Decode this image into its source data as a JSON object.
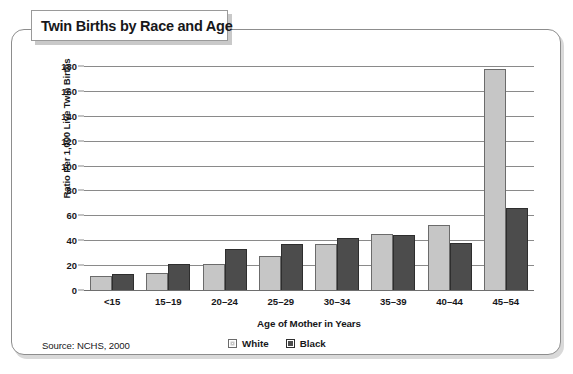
{
  "panel": {
    "title": "Twin Births by Race and Age",
    "source": "Source: NCHS, 2000"
  },
  "chart_data": {
    "type": "bar",
    "title": "Twin Births by Race and Age",
    "xlabel": "Age of Mother in Years",
    "ylabel": "Ratio Per 1,000 Live Twin Births",
    "ylim": [
      0,
      180
    ],
    "ytick_step": 20,
    "yticks": [
      0,
      20,
      40,
      60,
      80,
      100,
      120,
      140,
      160,
      180
    ],
    "grid": true,
    "legend_position": "bottom-right",
    "categories": [
      "<15",
      "15–19",
      "20–24",
      "25–29",
      "30–34",
      "35–39",
      "40–44",
      "45–54"
    ],
    "series": [
      {
        "name": "White",
        "color": "#c6c6c6",
        "values": [
          11,
          14,
          21,
          27,
          37,
          45,
          52,
          178
        ]
      },
      {
        "name": "Black",
        "color": "#4c4c4c",
        "values": [
          13,
          21,
          33,
          37,
          42,
          44,
          38,
          66
        ]
      }
    ],
    "source": "Source: NCHS, 2000"
  }
}
